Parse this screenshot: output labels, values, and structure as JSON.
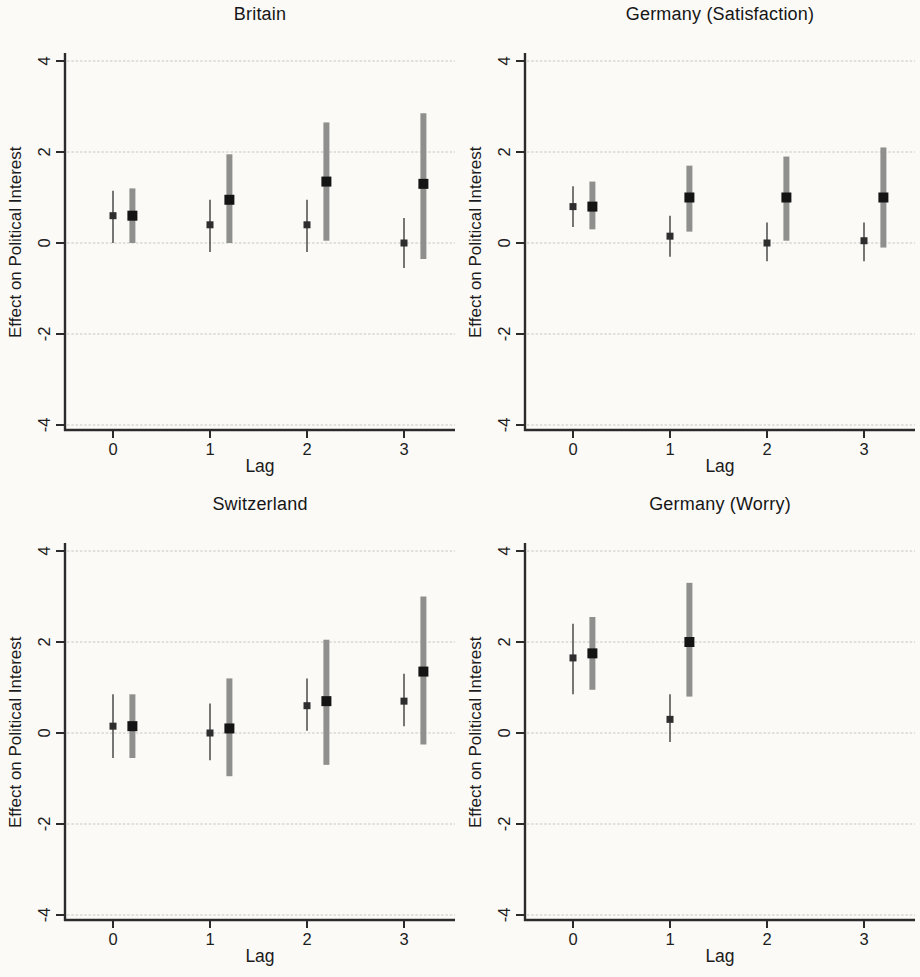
{
  "figure": {
    "kind": "coefficient-plot-grid",
    "background": "#fbfaf7",
    "colors": {
      "axis": "#2b2b2b",
      "grid": "#c6c6c2",
      "tick_label": "#1d1d1d",
      "thin_ci": "#4a4a4a",
      "thin_marker": "#2e2e2e",
      "thick_ci": "#8f8f8d",
      "thick_marker": "#141414"
    }
  },
  "chart_data": [
    {
      "type": "scatter",
      "title": "Britain",
      "xlabel": "Lag",
      "ylabel": "Effect on Political Interest",
      "xlim": [
        -0.5,
        3.5
      ],
      "ylim": [
        -4,
        4
      ],
      "xticks": [
        0,
        1,
        2,
        3
      ],
      "yticks": [
        4,
        2,
        0,
        -2,
        -4
      ],
      "grid": "horizontal",
      "legend": "none",
      "series": [
        {
          "name": "estimate-thin-ci",
          "marker": "small-square",
          "ci_style": "thin-line",
          "x_offset": 0,
          "points": [
            {
              "x": 0,
              "est": 0.6,
              "lo": 0.0,
              "hi": 1.15
            },
            {
              "x": 1,
              "est": 0.4,
              "lo": -0.2,
              "hi": 0.95
            },
            {
              "x": 2,
              "est": 0.4,
              "lo": -0.2,
              "hi": 0.95
            },
            {
              "x": 3,
              "est": 0.0,
              "lo": -0.55,
              "hi": 0.55
            }
          ]
        },
        {
          "name": "estimate-thick-ci",
          "marker": "large-square",
          "ci_style": "thick-band",
          "x_offset": 0.2,
          "points": [
            {
              "x": 0,
              "est": 0.6,
              "lo": 0.0,
              "hi": 1.2
            },
            {
              "x": 1,
              "est": 0.95,
              "lo": 0.0,
              "hi": 1.95
            },
            {
              "x": 2,
              "est": 1.35,
              "lo": 0.05,
              "hi": 2.65
            },
            {
              "x": 3,
              "est": 1.3,
              "lo": -0.35,
              "hi": 2.85
            }
          ]
        }
      ]
    },
    {
      "type": "scatter",
      "title": "Germany (Satisfaction)",
      "xlabel": "Lag",
      "ylabel": "Effect on Political Interest",
      "xlim": [
        -0.5,
        3.5
      ],
      "ylim": [
        -4,
        4
      ],
      "xticks": [
        0,
        1,
        2,
        3
      ],
      "yticks": [
        4,
        2,
        0,
        -2,
        -4
      ],
      "grid": "horizontal",
      "legend": "none",
      "series": [
        {
          "name": "estimate-thin-ci",
          "marker": "small-square",
          "ci_style": "thin-line",
          "x_offset": 0,
          "points": [
            {
              "x": 0,
              "est": 0.8,
              "lo": 0.35,
              "hi": 1.25
            },
            {
              "x": 1,
              "est": 0.15,
              "lo": -0.3,
              "hi": 0.6
            },
            {
              "x": 2,
              "est": 0.0,
              "lo": -0.4,
              "hi": 0.45
            },
            {
              "x": 3,
              "est": 0.05,
              "lo": -0.4,
              "hi": 0.45
            }
          ]
        },
        {
          "name": "estimate-thick-ci",
          "marker": "large-square",
          "ci_style": "thick-band",
          "x_offset": 0.2,
          "points": [
            {
              "x": 0,
              "est": 0.8,
              "lo": 0.3,
              "hi": 1.35
            },
            {
              "x": 1,
              "est": 1.0,
              "lo": 0.25,
              "hi": 1.7
            },
            {
              "x": 2,
              "est": 1.0,
              "lo": 0.05,
              "hi": 1.9
            },
            {
              "x": 3,
              "est": 1.0,
              "lo": -0.1,
              "hi": 2.1
            }
          ]
        }
      ]
    },
    {
      "type": "scatter",
      "title": "Switzerland",
      "xlabel": "Lag",
      "ylabel": "Effect on Political Interest",
      "xlim": [
        -0.5,
        3.5
      ],
      "ylim": [
        -4,
        4
      ],
      "xticks": [
        0,
        1,
        2,
        3
      ],
      "yticks": [
        4,
        2,
        0,
        -2,
        -4
      ],
      "grid": "horizontal",
      "legend": "none",
      "series": [
        {
          "name": "estimate-thin-ci",
          "marker": "small-square",
          "ci_style": "thin-line",
          "x_offset": 0,
          "points": [
            {
              "x": 0,
              "est": 0.15,
              "lo": -0.55,
              "hi": 0.85
            },
            {
              "x": 1,
              "est": 0.0,
              "lo": -0.6,
              "hi": 0.65
            },
            {
              "x": 2,
              "est": 0.6,
              "lo": 0.05,
              "hi": 1.2
            },
            {
              "x": 3,
              "est": 0.7,
              "lo": 0.15,
              "hi": 1.3
            }
          ]
        },
        {
          "name": "estimate-thick-ci",
          "marker": "large-square",
          "ci_style": "thick-band",
          "x_offset": 0.2,
          "points": [
            {
              "x": 0,
              "est": 0.15,
              "lo": -0.55,
              "hi": 0.85
            },
            {
              "x": 1,
              "est": 0.1,
              "lo": -0.95,
              "hi": 1.2
            },
            {
              "x": 2,
              "est": 0.7,
              "lo": -0.7,
              "hi": 2.05
            },
            {
              "x": 3,
              "est": 1.35,
              "lo": -0.25,
              "hi": 3.0
            }
          ]
        }
      ]
    },
    {
      "type": "scatter",
      "title": "Germany (Worry)",
      "xlabel": "Lag",
      "ylabel": "Effect on Political Interest",
      "xlim": [
        -0.5,
        3.5
      ],
      "ylim": [
        -4,
        4
      ],
      "xticks": [
        0,
        1,
        2,
        3
      ],
      "yticks": [
        4,
        2,
        0,
        -2,
        -4
      ],
      "grid": "horizontal",
      "legend": "none",
      "series": [
        {
          "name": "estimate-thin-ci",
          "marker": "small-square",
          "ci_style": "thin-line",
          "x_offset": 0,
          "points": [
            {
              "x": 0,
              "est": 1.65,
              "lo": 0.85,
              "hi": 2.4
            },
            {
              "x": 1,
              "est": 0.3,
              "lo": -0.2,
              "hi": 0.85
            }
          ]
        },
        {
          "name": "estimate-thick-ci",
          "marker": "large-square",
          "ci_style": "thick-band",
          "x_offset": 0.2,
          "points": [
            {
              "x": 0,
              "est": 1.75,
              "lo": 0.95,
              "hi": 2.55
            },
            {
              "x": 1,
              "est": 2.0,
              "lo": 0.8,
              "hi": 3.3
            }
          ]
        }
      ]
    }
  ]
}
